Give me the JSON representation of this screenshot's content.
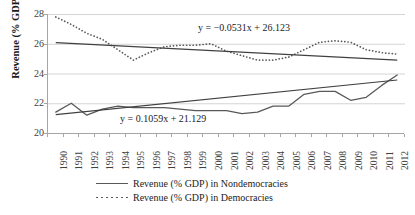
{
  "chart_data": {
    "type": "line",
    "title": "",
    "xlabel": "",
    "ylabel": "Revenue (% GDP)",
    "ylim": [
      20,
      28
    ],
    "yticks": [
      20,
      22,
      24,
      26,
      28
    ],
    "grid": true,
    "legend_position": "bottom",
    "categories": [
      "1990",
      "1991",
      "1992",
      "1993",
      "1994",
      "1995",
      "1996",
      "1997",
      "1998",
      "1999",
      "2000",
      "2001",
      "2002",
      "2003",
      "2004",
      "2005",
      "2006",
      "2007",
      "2008",
      "2009",
      "2010",
      "2011",
      "2012"
    ],
    "series": [
      {
        "name": "Revenue (% GDP) in Nondemocracies",
        "style": "solid",
        "color": "#595959",
        "values": [
          21.4,
          22.0,
          21.2,
          21.6,
          21.8,
          21.7,
          21.7,
          21.7,
          21.6,
          21.5,
          21.5,
          21.5,
          21.3,
          21.4,
          21.8,
          21.8,
          22.6,
          22.8,
          22.8,
          22.2,
          22.4,
          23.2,
          23.9
        ]
      },
      {
        "name": "Revenue (% GDP) in Democracies",
        "style": "dotted",
        "color": "#595959",
        "values": [
          27.8,
          27.3,
          26.7,
          26.3,
          25.6,
          24.9,
          25.4,
          25.8,
          25.9,
          25.9,
          26.0,
          25.5,
          25.2,
          24.9,
          24.9,
          25.1,
          25.6,
          26.1,
          26.2,
          26.1,
          25.6,
          25.4,
          25.3
        ]
      }
    ],
    "trendlines": [
      {
        "name": "Trendline for Democracies",
        "equation": "y = −0.0531x + 26.123",
        "slope": -0.0531,
        "intercept": 26.123,
        "color": "#404040"
      },
      {
        "name": "Trendline for Nondemocracies",
        "equation": "y = 0.1059x + 21.129",
        "slope": 0.1059,
        "intercept": 21.129,
        "color": "#404040"
      }
    ],
    "legend": [
      {
        "label": "Revenue (% GDP) in Nondemocracies",
        "style": "solid"
      },
      {
        "label": "Revenue (% GDP) in Democracies",
        "style": "dotted"
      }
    ]
  }
}
